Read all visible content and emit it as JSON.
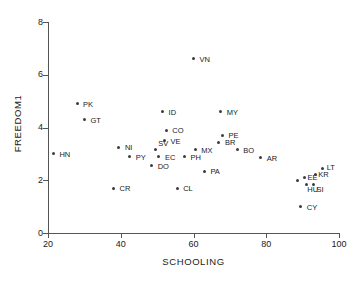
{
  "chart_data": {
    "type": "scatter",
    "title": "",
    "xlabel": "SCHOOLING",
    "ylabel": "FREEDOM1",
    "xlim": [
      20,
      100
    ],
    "ylim": [
      0,
      8
    ],
    "xticks": [
      20,
      40,
      60,
      80,
      100
    ],
    "yticks": [
      0,
      2,
      4,
      6,
      8
    ],
    "grid": false,
    "legend": null,
    "point_color": "#3c3c3c",
    "points": [
      {
        "label": "HN",
        "x": 21.5,
        "y": 3.0,
        "lx": 6,
        "ly": -3
      },
      {
        "label": "PK",
        "x": 28.0,
        "y": 4.9,
        "lx": 6,
        "ly": -3
      },
      {
        "label": "GT",
        "x": 30.0,
        "y": 4.3,
        "lx": 6,
        "ly": -3
      },
      {
        "label": "CR",
        "x": 38.0,
        "y": 1.7,
        "lx": 6,
        "ly": -3
      },
      {
        "label": "NI",
        "x": 39.5,
        "y": 3.25,
        "lx": 6,
        "ly": -3
      },
      {
        "label": "PY",
        "x": 42.5,
        "y": 2.9,
        "lx": 6,
        "ly": -3
      },
      {
        "label": "SV",
        "x": 49.5,
        "y": 3.15,
        "lx": 3,
        "ly": -10
      },
      {
        "label": "EC",
        "x": 50.5,
        "y": 2.9,
        "lx": 6,
        "ly": -3
      },
      {
        "label": "DO",
        "x": 48.5,
        "y": 2.55,
        "lx": 6,
        "ly": -3
      },
      {
        "label": "VE",
        "x": 52.0,
        "y": 3.5,
        "lx": 6,
        "ly": -3
      },
      {
        "label": "CO",
        "x": 52.5,
        "y": 3.9,
        "lx": 6,
        "ly": -3
      },
      {
        "label": "ID",
        "x": 51.5,
        "y": 4.6,
        "lx": 6,
        "ly": -3
      },
      {
        "label": "CL",
        "x": 55.5,
        "y": 1.7,
        "lx": 6,
        "ly": -3
      },
      {
        "label": "PH",
        "x": 57.5,
        "y": 2.9,
        "lx": 6,
        "ly": -3
      },
      {
        "label": "PA",
        "x": 63.0,
        "y": 2.35,
        "lx": 6,
        "ly": -3
      },
      {
        "label": "MX",
        "x": 60.5,
        "y": 3.15,
        "lx": 6,
        "ly": -3
      },
      {
        "label": "VN",
        "x": 60.0,
        "y": 6.6,
        "lx": 6,
        "ly": -3
      },
      {
        "label": "MY",
        "x": 67.5,
        "y": 4.6,
        "lx": 6,
        "ly": -3
      },
      {
        "label": "PE",
        "x": 68.0,
        "y": 3.7,
        "lx": 6,
        "ly": -3
      },
      {
        "label": "BR",
        "x": 67.0,
        "y": 3.45,
        "lx": 6,
        "ly": -3
      },
      {
        "label": "BO",
        "x": 72.0,
        "y": 3.15,
        "lx": 6,
        "ly": -3
      },
      {
        "label": "AR",
        "x": 78.5,
        "y": 2.85,
        "lx": 6,
        "ly": -3
      },
      {
        "label": "",
        "x": 88.5,
        "y": 2.0,
        "lx": 0,
        "ly": 0
      },
      {
        "label": "EE",
        "x": 90.5,
        "y": 2.1,
        "lx": 3,
        "ly": -4
      },
      {
        "label": "HU",
        "x": 91.0,
        "y": 1.85,
        "lx": 1,
        "ly": 2
      },
      {
        "label": "SI",
        "x": 93.0,
        "y": 1.85,
        "lx": 3,
        "ly": 2
      },
      {
        "label": "KR",
        "x": 93.5,
        "y": 2.2,
        "lx": 3,
        "ly": -4
      },
      {
        "label": "LT",
        "x": 95.5,
        "y": 2.45,
        "lx": 4,
        "ly": -4
      },
      {
        "label": "CY",
        "x": 89.5,
        "y": 1.0,
        "lx": 6,
        "ly": -3
      }
    ]
  }
}
